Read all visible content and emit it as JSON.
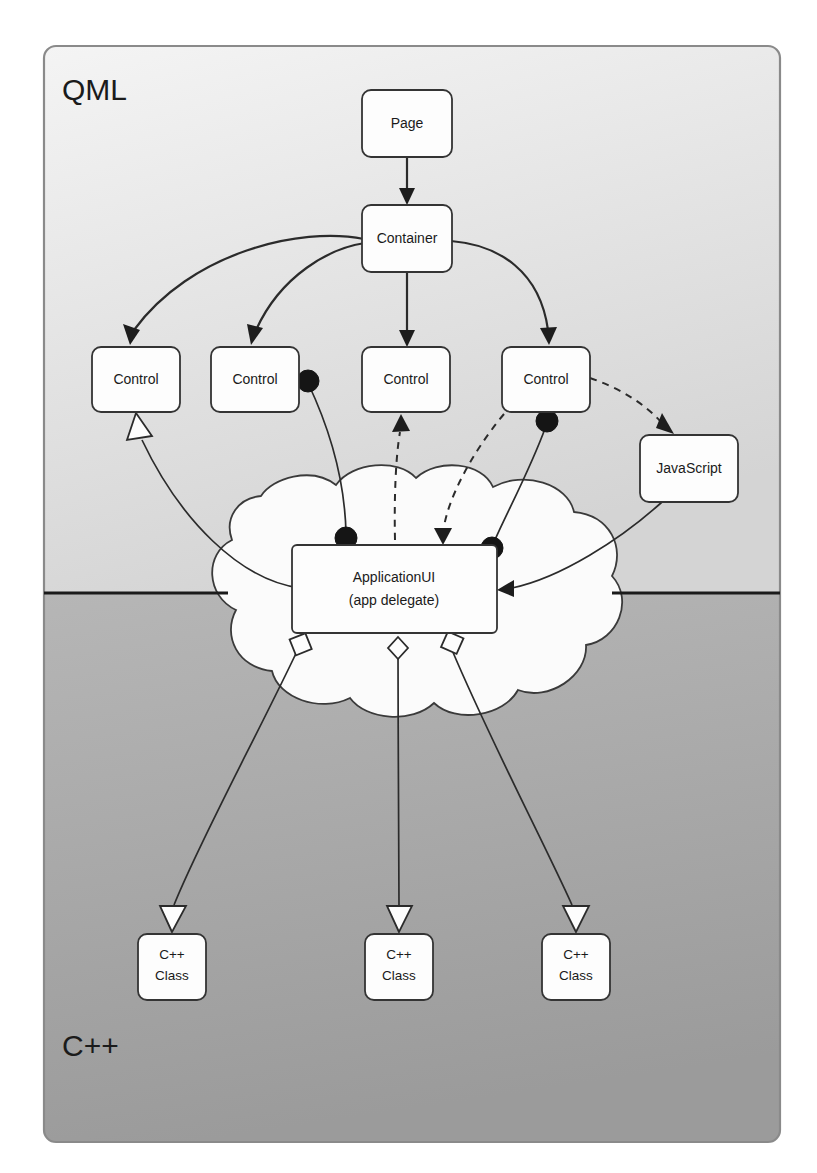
{
  "diagram": {
    "layers": [
      {
        "id": "qml",
        "label": "QML",
        "fill_top": "#f1f1f1",
        "fill_bottom": "#d6d6d6"
      },
      {
        "id": "cpp",
        "label": "C++",
        "fill_top": "#b3b3b3",
        "fill_bottom": "#9a9a9a"
      }
    ],
    "frame": {
      "stroke": "#7a7a7a",
      "divider_color": "#1a1a1a",
      "divider_y": 593
    },
    "cloud": {
      "name": "application-logic-cloud",
      "fill": "#fbfbfb",
      "stroke": "#3a3a3a"
    },
    "nodes": [
      {
        "id": "page",
        "label": "Page",
        "x": 362,
        "y": 90,
        "w": 90,
        "h": 67
      },
      {
        "id": "container",
        "label": "Container",
        "x": 362,
        "y": 205,
        "w": 90,
        "h": 67
      },
      {
        "id": "control1",
        "label": "Control",
        "x": 92,
        "y": 347,
        "w": 88,
        "h": 65
      },
      {
        "id": "control2",
        "label": "Control",
        "x": 211,
        "y": 347,
        "w": 88,
        "h": 65
      },
      {
        "id": "control3",
        "label": "Control",
        "x": 362,
        "y": 347,
        "w": 88,
        "h": 65
      },
      {
        "id": "control4",
        "label": "Control",
        "x": 502,
        "y": 347,
        "w": 88,
        "h": 65
      },
      {
        "id": "javascript",
        "label": "JavaScript",
        "x": 640,
        "y": 435,
        "w": 98,
        "h": 67
      },
      {
        "id": "appui",
        "label": "ApplicationUI",
        "label2": "(app delegate)",
        "x": 292,
        "y": 545,
        "w": 205,
        "h": 88
      },
      {
        "id": "cppclass1",
        "label": "C++",
        "label2": "Class",
        "x": 138,
        "y": 934,
        "w": 68,
        "h": 66
      },
      {
        "id": "cppclass2",
        "label": "C++",
        "label2": "Class",
        "x": 365,
        "y": 934,
        "w": 68,
        "h": 66
      },
      {
        "id": "cppclass3",
        "label": "C++",
        "label2": "Class",
        "x": 542,
        "y": 934,
        "w": 68,
        "h": 66
      }
    ],
    "edges": [
      {
        "id": "page-container",
        "from": "page",
        "to": "container",
        "style": "solid",
        "head": "filled-arrow"
      },
      {
        "id": "container-control1",
        "from": "container",
        "to": "control1",
        "style": "solid",
        "head": "filled-arrow"
      },
      {
        "id": "container-control2",
        "from": "container",
        "to": "control2",
        "style": "solid",
        "head": "filled-arrow"
      },
      {
        "id": "container-control3",
        "from": "container",
        "to": "control3",
        "style": "solid",
        "head": "filled-arrow"
      },
      {
        "id": "container-control4",
        "from": "container",
        "to": "control4",
        "style": "solid",
        "head": "filled-arrow"
      },
      {
        "id": "appui-control1",
        "from": "appui",
        "to": "control1",
        "style": "solid",
        "head": "hollow-triangle"
      },
      {
        "id": "control2-appui",
        "from": "control2",
        "to": "appui",
        "style": "solid",
        "head": "solid-dot"
      },
      {
        "id": "control4-appui",
        "from": "control4",
        "to": "appui",
        "style": "solid",
        "head": "solid-dot"
      },
      {
        "id": "appui-control3",
        "from": "appui",
        "to": "control3",
        "style": "dashed",
        "head": "filled-arrow"
      },
      {
        "id": "control4-appui-signal",
        "from": "control4",
        "to": "appui",
        "style": "dashed",
        "head": "filled-arrow"
      },
      {
        "id": "control4-javascript",
        "from": "control4",
        "to": "javascript",
        "style": "dashed",
        "head": "filled-arrow"
      },
      {
        "id": "javascript-appui",
        "from": "javascript",
        "to": "appui",
        "style": "solid",
        "head": "filled-arrow"
      },
      {
        "id": "appui-cppclass1",
        "from": "appui",
        "to": "cppclass1",
        "style": "solid",
        "head": "hollow-triangle",
        "tail": "hollow-square"
      },
      {
        "id": "appui-cppclass2",
        "from": "appui",
        "to": "cppclass2",
        "style": "solid",
        "head": "hollow-triangle",
        "tail": "hollow-diamond"
      },
      {
        "id": "appui-cppclass3",
        "from": "appui",
        "to": "cppclass3",
        "style": "solid",
        "head": "hollow-triangle",
        "tail": "hollow-square"
      }
    ]
  }
}
